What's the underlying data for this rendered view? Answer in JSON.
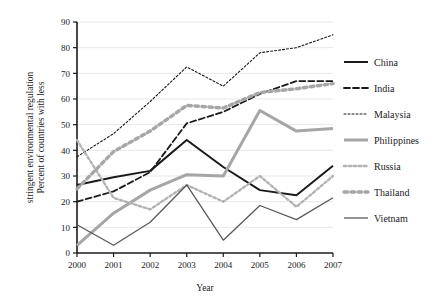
{
  "chart_data": {
    "type": "line",
    "title": "",
    "xlabel": "Year",
    "ylabel": "Percent of countries with less stringent environmental regulation",
    "ylabel_line1": "Percent of countries with less",
    "ylabel_line2": "stringent environmental regulation",
    "x": [
      2000,
      2001,
      2002,
      2003,
      2004,
      2005,
      2006,
      2007
    ],
    "categories": [
      "2000",
      "2001",
      "2002",
      "2003",
      "2004",
      "2005",
      "2006",
      "2007"
    ],
    "xlim": [
      2000,
      2007
    ],
    "ylim": [
      0,
      90
    ],
    "yticks": [
      0,
      10,
      20,
      30,
      40,
      50,
      60,
      70,
      80,
      90
    ],
    "ytick_labels": [
      "0",
      "10",
      "20",
      "30",
      "40",
      "50",
      "60",
      "70",
      "80",
      "90"
    ],
    "grid": true,
    "grid_axis": "y",
    "legend_position": "right",
    "series": [
      {
        "name": "China",
        "values": [
          26.5,
          29.5,
          32.0,
          44.0,
          33.5,
          24.5,
          22.5,
          34.0
        ],
        "color": "#1a1a1a",
        "style": "solid",
        "width": 2.0,
        "dash": "none"
      },
      {
        "name": "India",
        "values": [
          20.0,
          24.0,
          31.5,
          50.5,
          55.0,
          62.0,
          67.0,
          67.0
        ],
        "color": "#1a1a1a",
        "style": "dashed",
        "width": 1.8,
        "dash": "6,3"
      },
      {
        "name": "Malaysia",
        "values": [
          37.5,
          46.5,
          59.0,
          72.5,
          65.0,
          78.0,
          80.0,
          85.0
        ],
        "color": "#1a1a1a",
        "style": "dotted",
        "width": 1.1,
        "dash": "2,2"
      },
      {
        "name": "Philippines",
        "values": [
          3.0,
          15.5,
          24.5,
          30.5,
          30.0,
          55.5,
          47.5,
          48.5
        ],
        "color": "#a6a6a6",
        "style": "solid",
        "width": 3.0,
        "dash": "none"
      },
      {
        "name": "Russia",
        "values": [
          44.0,
          21.5,
          17.0,
          26.5,
          20.0,
          30.0,
          18.0,
          30.0
        ],
        "color": "#b3b3b3",
        "style": "dotted",
        "width": 2.4,
        "dash": "2.5,2.5"
      },
      {
        "name": "Thailand",
        "values": [
          25.0,
          39.5,
          47.5,
          57.5,
          56.5,
          62.5,
          64.0,
          66.0
        ],
        "color": "#a6a6a6",
        "style": "dotted",
        "width": 3.4,
        "dash": "3.5,3.5"
      },
      {
        "name": "Vietnam",
        "values": [
          11.0,
          3.0,
          12.0,
          26.5,
          5.0,
          18.5,
          13.0,
          21.5
        ],
        "color": "#595959",
        "style": "solid",
        "width": 1.3,
        "dash": "none"
      }
    ]
  },
  "legend": {
    "items": [
      {
        "label": "China"
      },
      {
        "label": "India"
      },
      {
        "label": "Malaysia"
      },
      {
        "label": "Philippines"
      },
      {
        "label": "Russia"
      },
      {
        "label": "Thailand"
      },
      {
        "label": "Vietnam"
      }
    ]
  }
}
